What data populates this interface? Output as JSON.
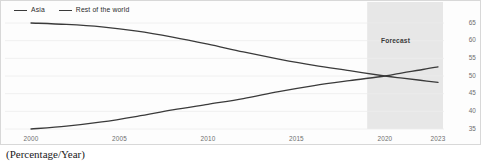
{
  "caption": "(Percentage/Year)",
  "legend": {
    "items": [
      {
        "label": "Asia",
        "color": "#3a3a3a",
        "marker": "line-dash-icon"
      },
      {
        "label": "Rest of the world",
        "color": "#3a3a3a",
        "marker": "line-dash-icon"
      }
    ]
  },
  "annotations": {
    "forecast_label": "Forecast"
  },
  "axis": {
    "y_ticks": [
      "65",
      "60",
      "55",
      "50",
      "45",
      "40",
      "35"
    ],
    "x_ticks": [
      "2000",
      "2005",
      "2010",
      "2015",
      "2020",
      "2023"
    ]
  },
  "chart_data": {
    "type": "line",
    "title": "",
    "subtitle": "",
    "xlabel": "",
    "ylabel": "",
    "caption": "(Percentage/Year)",
    "grid": true,
    "legend_position": "top-left",
    "xlim": [
      2000,
      2023
    ],
    "ylim": [
      33,
      67
    ],
    "y_ticks": [
      35,
      40,
      45,
      50,
      55,
      60,
      65
    ],
    "x_ticks": [
      2000,
      2005,
      2010,
      2015,
      2020,
      2023
    ],
    "shaded_region": {
      "label": "Forecast",
      "x_start": 2019,
      "x_end": 2023,
      "color": "#e3e3e3"
    },
    "x": [
      2000,
      2002,
      2004,
      2006,
      2008,
      2010,
      2012,
      2014,
      2016,
      2018,
      2020,
      2021,
      2022,
      2023
    ],
    "series": [
      {
        "name": "Asia",
        "color": "#3a3a3a",
        "values": [
          35.0,
          35.8,
          37.0,
          38.6,
          40.4,
          42.0,
          43.6,
          45.6,
          47.3,
          48.7,
          50.0,
          50.9,
          51.7,
          52.6
        ]
      },
      {
        "name": "Rest of the world",
        "color": "#3a3a3a",
        "values": [
          65.0,
          64.6,
          63.9,
          62.7,
          61.0,
          59.0,
          56.8,
          54.8,
          53.0,
          51.5,
          50.0,
          49.4,
          48.8,
          48.2
        ]
      }
    ]
  }
}
